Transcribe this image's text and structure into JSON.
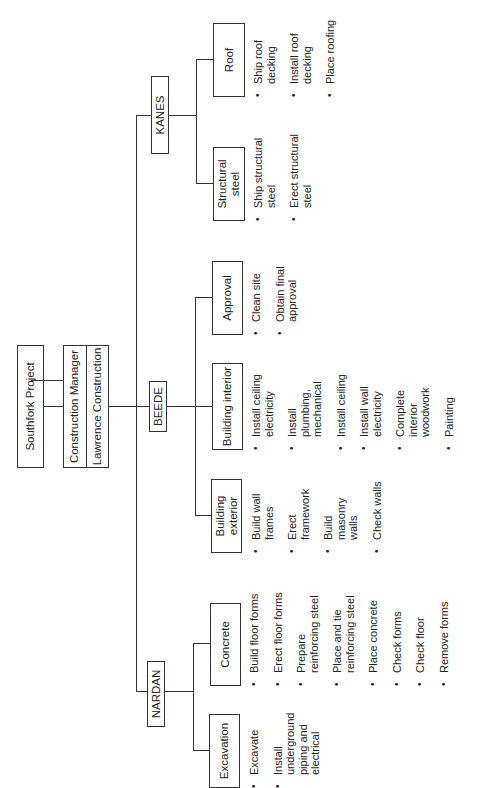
{
  "root": {
    "title": "Southfork Project",
    "manager_role": "Construction Manager",
    "manager_name": "Lawrence Construction"
  },
  "contractors": [
    {
      "name": "KANES",
      "packages": [
        {
          "name": "Structural steel",
          "tasks": [
            "Ship structural steel",
            "Erect structural steel"
          ]
        },
        {
          "name": "Roof",
          "tasks": [
            "Ship roof decking",
            "Install roof decking",
            "Place roofing"
          ]
        }
      ]
    },
    {
      "name": "BEEDE",
      "packages": [
        {
          "name": "Building exterior",
          "tasks": [
            "Build wall frames",
            "Erect framework",
            "Build masonry walls",
            "Check walls"
          ]
        },
        {
          "name": "Building interior",
          "tasks": [
            "Install ceiling electricity",
            "Install plumbing, mechanical",
            "Install ceiling",
            "Install wall electricity",
            "Complete interior woodwork",
            "Painting"
          ]
        },
        {
          "name": "Approval",
          "tasks": [
            "Clean site",
            "Obtain final approval"
          ]
        }
      ]
    },
    {
      "name": "NARDAN",
      "packages": [
        {
          "name": "Excavation",
          "tasks": [
            "Excavate",
            "Install underground piping and electrical"
          ]
        },
        {
          "name": "Concrete",
          "tasks": [
            "Build floor forms",
            "Erect floor forms",
            "Prepare reinforcing steel",
            "Place and tie reinforcing steel",
            "Place concrete",
            "Check forms",
            "Check floor",
            "Remove forms"
          ]
        }
      ]
    }
  ],
  "colors": {
    "line": "#333333",
    "text": "#222222",
    "background": "#ffffff"
  }
}
